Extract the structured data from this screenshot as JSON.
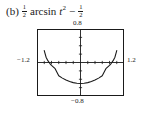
{
  "caption": {
    "item_label": "(b)",
    "coefficient": {
      "numerator": "1",
      "denominator": "2"
    },
    "function_name": "arcsin",
    "variable": "t",
    "exponent": "2",
    "operator": "−",
    "constant": {
      "numerator": "1",
      "denominator": "2"
    },
    "full_text": "(b) 1/2 arcsin t^2 - 1/2"
  },
  "chart_data": {
    "type": "line",
    "title": "",
    "xlabel": "",
    "ylabel": "",
    "xlim": [
      -1.2,
      1.2
    ],
    "ylim": [
      -0.8,
      0.8
    ],
    "grid": false,
    "legend": "none",
    "axis_ticks_visible": true,
    "tick_spacing_x": 0.2,
    "tick_spacing_y": 0.2,
    "tick_labels": {
      "xmin": "−1.2",
      "xmax": "1.2",
      "ymax": "0.8",
      "ymin": "−0.8"
    },
    "series": [
      {
        "name": "y = (1/2)arcsin(t^2) - 1/2",
        "color": "#1a1a1a",
        "x": [
          -1.0,
          -0.95,
          -0.9,
          -0.85,
          -0.8,
          -0.7,
          -0.6,
          -0.5,
          -0.4,
          -0.3,
          -0.2,
          -0.1,
          0.0,
          0.1,
          0.2,
          0.3,
          0.4,
          0.5,
          0.6,
          0.7,
          0.8,
          0.85,
          0.9,
          0.95,
          1.0
        ],
        "y": [
          0.285,
          0.128,
          0.044,
          -0.019,
          -0.069,
          -0.147,
          -0.315,
          -0.373,
          -0.419,
          -0.455,
          -0.48,
          -0.495,
          -0.5,
          -0.495,
          -0.48,
          -0.455,
          -0.419,
          -0.373,
          -0.315,
          -0.147,
          -0.069,
          -0.019,
          0.044,
          0.128,
          0.285
        ]
      }
    ]
  },
  "colors": {
    "curve": "#1a1a1a",
    "axis": "#1a1a1a",
    "frame": "#1a1a1a",
    "background": "#ffffff"
  }
}
